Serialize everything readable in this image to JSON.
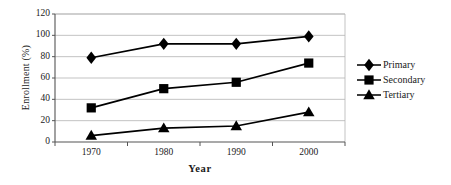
{
  "chart_data": {
    "type": "line",
    "title": "",
    "subtitle": "",
    "xlabel": "Year",
    "ylabel": "Enrollment (%)",
    "categories": [
      "1970",
      "1980",
      "1990",
      "2000"
    ],
    "x": [
      1970,
      1980,
      1990,
      2000
    ],
    "xlim": [
      1965,
      2005
    ],
    "ylim": [
      0,
      120
    ],
    "ytick_values": [
      0,
      20,
      40,
      60,
      80,
      100,
      120
    ],
    "ytick_labels": [
      "0",
      "20",
      "40",
      "60",
      "80",
      "100",
      "120"
    ],
    "xtick_labels": [
      "1970",
      "1980",
      "1990",
      "2000"
    ],
    "grid": "horizontal",
    "legend_position": "right",
    "series": [
      {
        "name": "Primary",
        "marker": "diamond",
        "color": "#000000",
        "values": [
          79,
          92,
          92,
          99
        ]
      },
      {
        "name": "Secondary",
        "marker": "square",
        "color": "#000000",
        "values": [
          32,
          50,
          56,
          74
        ]
      },
      {
        "name": "Tertiary",
        "marker": "triangle",
        "color": "#000000",
        "values": [
          6,
          13,
          15,
          28
        ]
      }
    ]
  },
  "legend": {
    "items": [
      {
        "label": "Primary",
        "marker": "diamond"
      },
      {
        "label": "Secondary",
        "marker": "square"
      },
      {
        "label": "Tertiary",
        "marker": "triangle"
      }
    ]
  },
  "axes": {
    "y_title": "Enrollment (%)",
    "x_title": "Year",
    "y_ticks": [
      "0",
      "20",
      "40",
      "60",
      "80",
      "100",
      "120"
    ],
    "x_ticks": [
      "1970",
      "1980",
      "1990",
      "2000"
    ]
  },
  "colors": {
    "line": "#1a1a1a",
    "marker": "#000000",
    "grid": "#b4b4b4",
    "axis": "#555555",
    "background": "#ffffff"
  }
}
